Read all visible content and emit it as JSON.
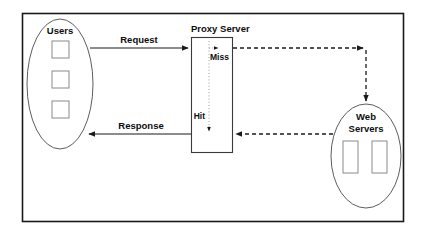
{
  "diagram": {
    "frame": {
      "stroke_color": "#1a1a1a"
    },
    "nodes": {
      "users": {
        "label": "Users",
        "shape": "ellipse",
        "unit_count": 3
      },
      "proxy": {
        "label": "Proxy Server",
        "shape": "rectangle"
      },
      "web_servers": {
        "label_line1": "Web",
        "label_line2": "Servers",
        "shape": "ellipse",
        "unit_count": 2
      }
    },
    "edges": {
      "request": {
        "label": "Request",
        "style": "solid",
        "from": "users",
        "to": "proxy",
        "direction": "right"
      },
      "response": {
        "label": "Response",
        "style": "solid",
        "from": "proxy",
        "to": "users",
        "direction": "left"
      },
      "miss": {
        "label": "Miss",
        "style": "dashed",
        "from": "proxy",
        "to": "web_servers",
        "direction": "right-then-down"
      },
      "hit": {
        "label": "Hit",
        "style": "dotted",
        "from": "proxy",
        "to": "response",
        "direction": "down"
      },
      "fetch_return": {
        "label": "",
        "style": "dashed",
        "from": "web_servers",
        "to": "proxy",
        "direction": "left"
      }
    },
    "colors": {
      "ink": "#1a1a1a",
      "node_stroke": "#5d5d5d",
      "unit_stroke": "#8a8a8a",
      "cache_path": "#9a9a9a",
      "background": "#ffffff"
    }
  }
}
